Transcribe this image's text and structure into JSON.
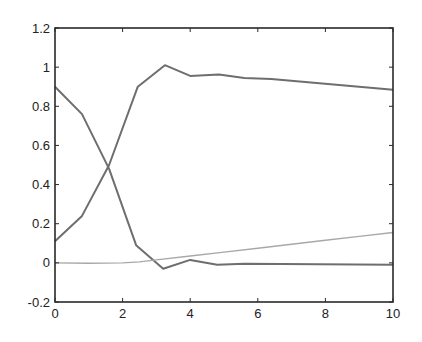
{
  "chart_data": {
    "type": "line",
    "title": "",
    "xlabel": "",
    "ylabel": "",
    "xlim": [
      0,
      10
    ],
    "ylim": [
      -0.2,
      1.2
    ],
    "grid": false,
    "legend": null,
    "x_ticks": [
      0,
      2,
      4,
      6,
      8,
      10
    ],
    "x_tick_labels": [
      "0",
      "2",
      "4",
      "6",
      "8",
      "10"
    ],
    "y_ticks": [
      -0.2,
      0,
      0.2,
      0.4,
      0.6,
      0.8,
      1,
      1.2
    ],
    "y_tick_labels": [
      "-0.2",
      "0",
      "0.2",
      "0.4",
      "0.6",
      "0.8",
      "1",
      "1.2"
    ],
    "series": [
      {
        "name": "rising curve",
        "color": "#6e6e6e",
        "x": [
          0,
          0.8,
          1.6,
          2.45,
          3.25,
          4.0,
          4.85,
          5.6,
          6.4,
          10
        ],
        "y": [
          0.11,
          0.24,
          0.5,
          0.9,
          1.01,
          0.955,
          0.962,
          0.945,
          0.94,
          0.885
        ]
      },
      {
        "name": "falling curve",
        "color": "#6e6e6e",
        "x": [
          0,
          0.8,
          1.6,
          2.4,
          3.2,
          4.0,
          4.8,
          5.6,
          10
        ],
        "y": [
          0.9,
          0.76,
          0.48,
          0.09,
          -0.03,
          0.015,
          -0.01,
          -0.005,
          -0.01
        ]
      },
      {
        "name": "slow growth curve",
        "color": "#a8a8a8",
        "x": [
          0,
          1.0,
          2.0,
          2.5,
          3.0,
          4.0,
          5.0,
          6.0,
          7.0,
          8.0,
          9.0,
          10
        ],
        "y": [
          0,
          -0.002,
          0.0,
          0.005,
          0.015,
          0.035,
          0.055,
          0.075,
          0.095,
          0.115,
          0.135,
          0.155
        ]
      }
    ]
  },
  "style": {
    "axis_color": "#2a2a2a",
    "background": "#ffffff"
  }
}
